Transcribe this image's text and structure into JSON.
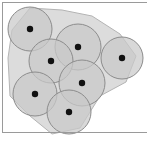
{
  "figure": {
    "canvas": {
      "width": 149,
      "height": 143,
      "background": "#ffffff"
    },
    "colors": {
      "disc_fill": "#c9c9c9",
      "disc_stroke": "#8c8c8c",
      "hull_fill": "#dcdcdc",
      "hull_stroke": "#b4b4b4",
      "center_dot": "#111111",
      "frame_stroke": "#9a9a9a"
    },
    "frame": {
      "top_line": {
        "x1": 2,
        "y1": 2,
        "x2": 147,
        "y2": 2
      },
      "left_line": {
        "x1": 2,
        "y1": 2,
        "x2": 2,
        "y2": 132
      },
      "bottom_line": {
        "x1": 2,
        "y1": 132,
        "x2": 147,
        "y2": 132
      }
    },
    "hull": {
      "label": "union-region-blob",
      "points": "30,8 62,10 92,16 120,34 136,56 126,82 100,96 80,128 52,134 30,116 10,96 8,58 12,30"
    },
    "discs": [
      {
        "id": 1,
        "label": "disc-top-left",
        "cx": 30,
        "cy": 29,
        "r": 22
      },
      {
        "id": 2,
        "label": "disc-upper-middle",
        "cx": 78,
        "cy": 47,
        "r": 23
      },
      {
        "id": 3,
        "label": "disc-right",
        "cx": 122,
        "cy": 58,
        "r": 21
      },
      {
        "id": 4,
        "label": "disc-middle-left",
        "cx": 51,
        "cy": 61,
        "r": 22
      },
      {
        "id": 5,
        "label": "disc-center",
        "cx": 82,
        "cy": 83,
        "r": 23
      },
      {
        "id": 6,
        "label": "disc-bottom-left",
        "cx": 35,
        "cy": 94,
        "r": 22
      },
      {
        "id": 7,
        "label": "disc-bottom-center",
        "cx": 69,
        "cy": 112,
        "r": 22
      }
    ],
    "center_dot_radius": 3.2,
    "counts": {
      "discs": 7,
      "centers": 7
    }
  }
}
